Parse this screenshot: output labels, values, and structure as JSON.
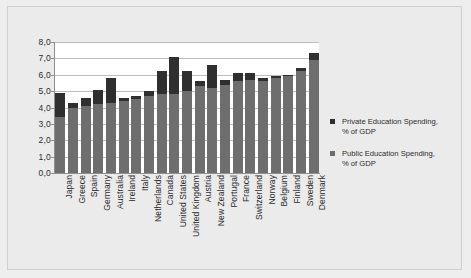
{
  "chart_data": {
    "type": "bar",
    "subtype": "stacked-vertical",
    "title": "",
    "subtitle": "",
    "xlabel": "",
    "ylabel": "",
    "ylim": [
      0,
      8
    ],
    "ytick_labels": [
      "8,0",
      "7,0",
      "6,0",
      "5,0",
      "4,0",
      "3,0",
      "2,0",
      "1,0",
      "0,0"
    ],
    "ytick_values": [
      8,
      7,
      6,
      5,
      4,
      3,
      2,
      1,
      0
    ],
    "decimal_separator": ",",
    "grid": "horizontal",
    "legend_position": "right",
    "categories": [
      "Japan",
      "Greece",
      "Spain",
      "Germany",
      "Australia",
      "Ireland",
      "Italy",
      "Netherlands",
      "Canada",
      "United States",
      "United Kingdom",
      "Austria",
      "New Zealand",
      "Portugal",
      "France",
      "Switzerland",
      "Norway",
      "Belgium",
      "Finland",
      "Sweden",
      "Denmark"
    ],
    "series": [
      {
        "name": "Public Education Spending, % of GDP",
        "color": "#6e6e6e",
        "values": [
          3.4,
          4.0,
          4.1,
          4.2,
          4.3,
          4.4,
          4.5,
          4.7,
          4.8,
          4.8,
          5.0,
          5.3,
          5.2,
          5.4,
          5.6,
          5.7,
          5.6,
          5.8,
          5.9,
          6.2,
          6.9
        ]
      },
      {
        "name": "Private Education Spending, % of GDP",
        "color": "#2f2f2f",
        "values": [
          1.5,
          0.3,
          0.5,
          0.9,
          1.5,
          0.2,
          0.2,
          0.3,
          1.4,
          2.3,
          1.2,
          0.3,
          1.4,
          0.3,
          0.5,
          0.4,
          0.2,
          0.15,
          0.1,
          0.2,
          0.4
        ]
      }
    ],
    "totals": [
      4.9,
      4.3,
      4.6,
      5.1,
      5.8,
      4.6,
      4.7,
      5.0,
      6.2,
      7.1,
      6.2,
      5.6,
      6.6,
      5.7,
      6.1,
      6.1,
      5.8,
      5.95,
      6.0,
      6.4,
      7.3
    ]
  },
  "legend": {
    "items": [
      {
        "label_line1": "Private Education Spending,",
        "label_line2": "% of GDP",
        "color": "#2f2f2f"
      },
      {
        "label_line1": "Public Education Spending,",
        "label_line2": "% of GDP",
        "color": "#6e6e6e"
      }
    ]
  },
  "colors": {
    "page_background": "#eeeeee",
    "frame_background": "#ebebeb",
    "plot_background": "#ffffff",
    "gridline": "#bdbdbd",
    "axis": "#8f8f8f",
    "text": "#2b2b2b"
  }
}
